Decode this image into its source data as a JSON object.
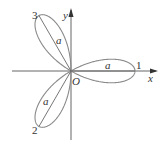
{
  "diagram": {
    "type": "polar-rose",
    "labels": {
      "x_axis": "x",
      "y_axis": "y",
      "origin": "O",
      "petal_1": "1",
      "petal_2": "2",
      "petal_3": "3",
      "radius_1": "a",
      "radius_2": "a",
      "radius_3": "a"
    },
    "colors": {
      "curve": "#8a8a8a",
      "axis": "#555555",
      "text": "#333333",
      "background": "#ffffff"
    }
  }
}
